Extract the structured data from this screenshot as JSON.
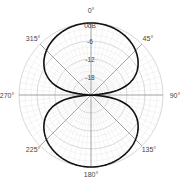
{
  "chart_data": {
    "type": "polar",
    "title": "",
    "pattern": "figure-8 (bidirectional)",
    "radial_unit": "dB",
    "radial_range": [
      -24,
      0
    ],
    "radial_ticks": [
      {
        "value": 0,
        "label": "0dB"
      },
      {
        "value": -6,
        "label": "-6"
      },
      {
        "value": -12,
        "label": "-12"
      },
      {
        "value": -18,
        "label": "-18"
      }
    ],
    "angle_labels": [
      {
        "angle": 0,
        "label": "0°"
      },
      {
        "angle": 45,
        "label": "45°"
      },
      {
        "angle": 90,
        "label": "90°"
      },
      {
        "angle": 135,
        "label": "135°"
      },
      {
        "angle": 180,
        "label": "180°"
      },
      {
        "angle": 225,
        "label": "225°"
      },
      {
        "angle": 270,
        "label": "270°"
      },
      {
        "angle": 315,
        "label": "315°"
      }
    ],
    "grid": true,
    "series": [
      {
        "name": "response",
        "color": "#111111",
        "angles": [
          0,
          15,
          30,
          45,
          60,
          75,
          90,
          105,
          120,
          135,
          150,
          165,
          180,
          195,
          210,
          225,
          240,
          255,
          270,
          285,
          300,
          315,
          330,
          345,
          360
        ],
        "values_db": [
          0,
          -0.3,
          -1.25,
          -3.0,
          -6.0,
          -11.7,
          -24,
          -11.7,
          -6.0,
          -3.0,
          -1.25,
          -0.3,
          0,
          -0.3,
          -1.25,
          -3.0,
          -6.0,
          -11.7,
          -24,
          -11.7,
          -6.0,
          -3.0,
          -1.25,
          -0.3,
          0
        ]
      }
    ]
  }
}
